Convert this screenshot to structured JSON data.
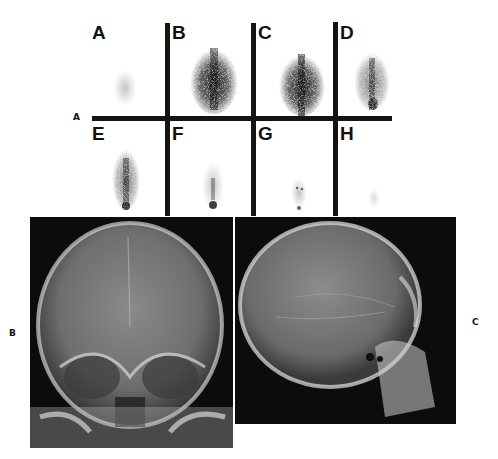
{
  "figure": {
    "labels": {
      "a": "A",
      "b": "B",
      "c": "C"
    },
    "scan_panels": [
      {
        "letter": "A",
        "intensity": 0.12
      },
      {
        "letter": "B",
        "intensity": 1.0
      },
      {
        "letter": "C",
        "intensity": 0.95
      },
      {
        "letter": "D",
        "intensity": 0.55
      },
      {
        "letter": "E",
        "intensity": 0.5
      },
      {
        "letter": "F",
        "intensity": 0.3
      },
      {
        "letter": "G",
        "intensity": 0.15
      },
      {
        "letter": "H",
        "intensity": 0.08
      }
    ],
    "xray_frontal": {
      "description": "frontal skull radiograph"
    },
    "xray_lateral": {
      "description": "lateral skull radiograph"
    }
  }
}
